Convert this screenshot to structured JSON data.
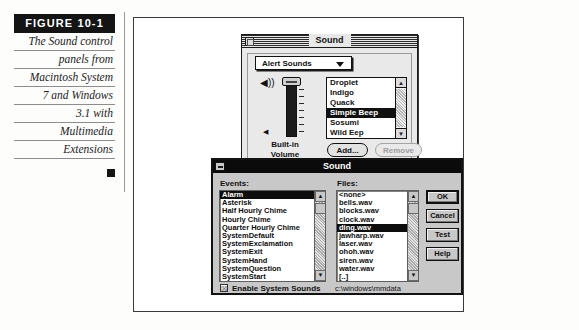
{
  "figure": {
    "label": "FIGURE 10-1",
    "caption_lines": [
      "The Sound control",
      "panels from",
      "Macintosh System",
      "7 and Windows",
      "3.1 with",
      "Multimedia",
      "Extensions"
    ]
  },
  "mac_sound_panel": {
    "title": "Sound",
    "close_box": "close-box",
    "popup_selected": "Alert Sounds",
    "popup_arrow": "chevron-down-icon",
    "volume_label": "Built-in\nVolume",
    "volume_label_line1": "Built-in",
    "volume_label_line2": "Volume",
    "speaker_loud_icon": "speaker-loud-icon",
    "speaker_quiet_icon": "speaker-quiet-icon",
    "sounds": [
      {
        "name": "Droplet",
        "selected": false
      },
      {
        "name": "Indigo",
        "selected": false
      },
      {
        "name": "Quack",
        "selected": false
      },
      {
        "name": "Simple Beep",
        "selected": true
      },
      {
        "name": "Sosumi",
        "selected": false
      },
      {
        "name": "Wild Eep",
        "selected": false
      }
    ],
    "add_label": "Add...",
    "remove_label": "Remove",
    "remove_disabled": true,
    "scroll_up": "▲",
    "scroll_down": "▼"
  },
  "windows_sound_dialog": {
    "title": "Sound",
    "minimize_icon": "minimize-box-icon",
    "events_label": "Events:",
    "files_label": "Files:",
    "events": [
      {
        "name": "Alarm",
        "selected": true
      },
      {
        "name": "Asterisk",
        "selected": false
      },
      {
        "name": "Half Hourly Chime",
        "selected": false
      },
      {
        "name": "Hourly Chime",
        "selected": false
      },
      {
        "name": "Quarter Hourly Chime",
        "selected": false
      },
      {
        "name": "SystemDefault",
        "selected": false
      },
      {
        "name": "SystemExclamation",
        "selected": false
      },
      {
        "name": "SystemExit",
        "selected": false
      },
      {
        "name": "SystemHand",
        "selected": false
      },
      {
        "name": "SystemQuestion",
        "selected": false
      },
      {
        "name": "SystemStart",
        "selected": false
      }
    ],
    "files": [
      {
        "name": "<none>",
        "selected": false
      },
      {
        "name": "bells.wav",
        "selected": false
      },
      {
        "name": "blocks.wav",
        "selected": false
      },
      {
        "name": "clock.wav",
        "selected": false
      },
      {
        "name": "ding.wav",
        "selected": true
      },
      {
        "name": "jawharp.wav",
        "selected": false
      },
      {
        "name": "laser.wav",
        "selected": false
      },
      {
        "name": "ohoh.wav",
        "selected": false
      },
      {
        "name": "siren.wav",
        "selected": false
      },
      {
        "name": "water.wav",
        "selected": false
      },
      {
        "name": "[..]",
        "selected": false
      }
    ],
    "buttons": {
      "ok": "OK",
      "cancel": "Cancel",
      "test": "Test",
      "help": "Help"
    },
    "enable_system_sounds_label": "Enable System Sounds",
    "enable_system_sounds_checked": true,
    "check_glyph": "☒",
    "path": "c:\\windows\\mmdata",
    "scroll_up": "▲",
    "scroll_down": "▼"
  },
  "colors": {
    "ink": "#141414",
    "paper": "#fdfdfc",
    "win_face": "#c8c8c8",
    "mac_face": "#e9e9e9",
    "selection": "#0d0d0d"
  }
}
